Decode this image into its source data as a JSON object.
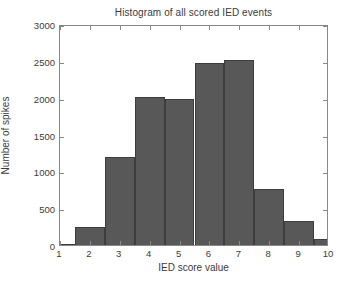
{
  "figure": {
    "width": 347,
    "height": 282,
    "background": "#ffffff",
    "axes_color": "#888888",
    "text_color": "#3b3b3b"
  },
  "chart_data": {
    "type": "bar",
    "title": "Histogram of all scored IED events",
    "xlabel": "IED score value",
    "ylabel": "Number of spikes",
    "categories": [
      "1",
      "2",
      "3",
      "4",
      "5",
      "6",
      "7",
      "8",
      "9",
      "10"
    ],
    "values": [
      20,
      250,
      1200,
      2010,
      1985,
      2470,
      2510,
      760,
      320,
      75
    ],
    "bin_centers": [
      1,
      2,
      3,
      4,
      5,
      6,
      7,
      8,
      9,
      10
    ],
    "bin_width": 1,
    "xlim": [
      1,
      10
    ],
    "ylim": [
      0,
      3000
    ],
    "xticks": [
      1,
      2,
      3,
      4,
      5,
      6,
      7,
      8,
      9,
      10
    ],
    "yticks": [
      0,
      500,
      1000,
      1500,
      2000,
      2500,
      3000
    ],
    "xtick_labels": [
      "1",
      "2",
      "3",
      "4",
      "5",
      "6",
      "7",
      "8",
      "9",
      "10"
    ],
    "ytick_labels": [
      "0",
      "500",
      "1000",
      "1500",
      "2000",
      "2500",
      "3000"
    ],
    "grid": false,
    "legend": null,
    "bar_color": "#585858",
    "bar_edge_color": "#3d3d3d"
  }
}
